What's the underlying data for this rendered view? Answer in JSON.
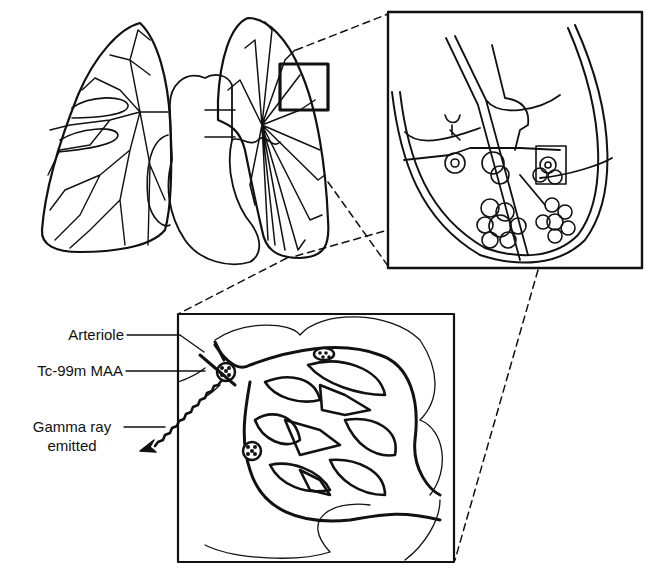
{
  "diagram": {
    "title": "",
    "colors": {
      "ink": "#111111",
      "background": "#ffffff"
    },
    "panels": [
      {
        "id": "lungs-overview",
        "description": "Front view of both lungs and heart with pulmonary vascular branching; small square highlights a region of the left lung"
      },
      {
        "id": "lung-segment-zoom",
        "description": "Magnified lung segment showing bronchioles, alveolar clusters and small square highlighting one alveolus"
      },
      {
        "id": "alveolus-zoom",
        "description": "Magnified alveolus/capillary bed with Tc-99m MAA particles lodged in arterioles"
      }
    ],
    "labels": {
      "arteriole": "Arteriole",
      "tc99m_maa": "Tc-99m MAA",
      "gamma_ray_line1": "Gamma ray",
      "gamma_ray_line2": "emitted"
    }
  }
}
